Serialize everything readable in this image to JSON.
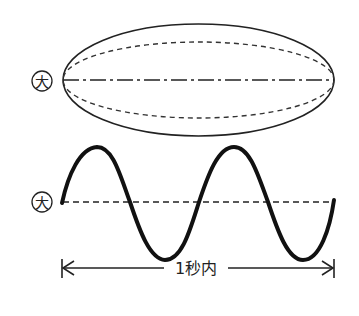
{
  "diagram": {
    "ellipse_marker": "大",
    "wave_marker": "大",
    "duration_label": "1秒内",
    "colors": {
      "stroke": "#1a1a1a",
      "background": "#ffffff"
    }
  }
}
